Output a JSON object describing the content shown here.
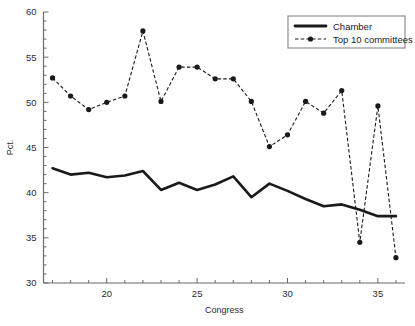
{
  "chart_data": {
    "type": "line",
    "title": "",
    "xlabel": "Congress",
    "ylabel": "Pct.",
    "xlim": [
      16.5,
      36.5
    ],
    "ylim": [
      30,
      60
    ],
    "x_ticks": [
      20,
      25,
      30,
      35
    ],
    "y_ticks": [
      30,
      35,
      40,
      45,
      50,
      55,
      60
    ],
    "x_minor_step": 1,
    "y_minor_step": 1,
    "grid": false,
    "legend_position": "top-right",
    "x": [
      17,
      18,
      19,
      20,
      21,
      22,
      23,
      24,
      25,
      26,
      27,
      28,
      29,
      30,
      31,
      32,
      33,
      34,
      35,
      36
    ],
    "series": [
      {
        "name": "Chamber",
        "style": "solid-thick",
        "markers": false,
        "color": "#1a1a1a",
        "values": [
          42.7,
          42.0,
          42.2,
          41.7,
          41.9,
          42.4,
          40.3,
          41.1,
          40.3,
          40.9,
          41.8,
          39.5,
          41.0,
          40.2,
          39.3,
          38.5,
          38.7,
          38.1,
          37.4,
          37.4
        ]
      },
      {
        "name": "Top 10 committees",
        "style": "dashed-marker",
        "markers": true,
        "color": "#1a1a1a",
        "values": [
          52.7,
          50.7,
          49.2,
          50.0,
          50.7,
          57.9,
          50.1,
          53.9,
          53.9,
          52.6,
          52.6,
          50.1,
          45.1,
          46.4,
          50.1,
          48.8,
          51.3,
          34.5,
          49.6,
          32.8
        ]
      }
    ]
  },
  "legend": {
    "items": [
      {
        "label": "Chamber",
        "swatch": "solid-thick-line"
      },
      {
        "label": "Top 10 committees",
        "swatch": "dashed-line-with-marker"
      }
    ]
  },
  "axes": {
    "y_tick_labels": [
      "60",
      "55",
      "50",
      "45",
      "40",
      "35",
      "30"
    ],
    "x_tick_labels": [
      "20",
      "25",
      "30",
      "35"
    ],
    "y_axis_title": "Pct.",
    "x_axis_title": "Congress"
  }
}
